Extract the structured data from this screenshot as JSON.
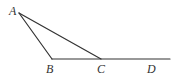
{
  "diagram": {
    "type": "geometry",
    "points": {
      "A": {
        "label": "A",
        "x": 19,
        "y": 13
      },
      "B": {
        "label": "B",
        "x": 52,
        "y": 59
      },
      "C": {
        "label": "C",
        "x": 101,
        "y": 59
      },
      "D": {
        "label": "D",
        "x": 151,
        "y": 59
      }
    },
    "segments": [
      {
        "from": "A",
        "to": "B"
      },
      {
        "from": "A",
        "to": "C"
      },
      {
        "from": "B",
        "to": "ray_end",
        "through": [
          "C",
          "D"
        ]
      }
    ],
    "ray_end": {
      "x": 170,
      "y": 59
    },
    "stroke_color": "#333333"
  }
}
